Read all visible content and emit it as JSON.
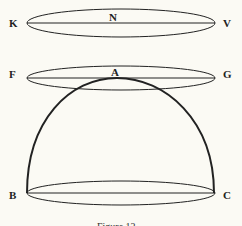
{
  "labels": {
    "K": "K",
    "N": "N",
    "V": "V",
    "F": "F",
    "A": "A",
    "G": "G",
    "B": "B",
    "C": "C"
  },
  "caption": "Figure 12"
}
